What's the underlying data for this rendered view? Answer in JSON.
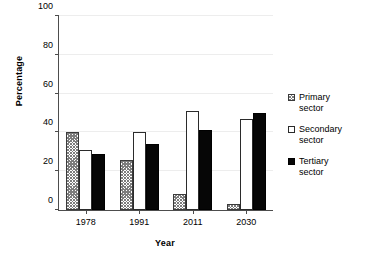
{
  "chart_data": {
    "type": "bar",
    "title": "",
    "subtitle": "",
    "xlabel": "Year",
    "ylabel": "Percentage",
    "categories": [
      "1978",
      "1991",
      "2011",
      "2030"
    ],
    "series": [
      {
        "name": "Primary sector",
        "values": [
          40,
          26,
          8,
          3
        ],
        "swatch": "hatched-square"
      },
      {
        "name": "Secondary sector",
        "values": [
          31,
          40,
          51,
          47
        ],
        "swatch": "white-square"
      },
      {
        "name": "Tertiary sector",
        "values": [
          29,
          34,
          41,
          50
        ],
        "swatch": "black-square"
      }
    ],
    "ylim": [
      0,
      100
    ],
    "yticks": [
      0,
      20,
      40,
      60,
      80,
      100
    ],
    "ytick_labels": [
      "0",
      "20",
      "40",
      "60",
      "80",
      "100"
    ],
    "grid": "horizontal",
    "legend_position": "right",
    "colors": {
      "primary": "#7d7d7d",
      "secondary": "#ffffff",
      "tertiary": "#060606",
      "axis": "#4d4d4d",
      "gridline": "#ededed",
      "background": "#ffffff"
    }
  },
  "legend": {
    "items": [
      {
        "label_line1": "Primary",
        "label_line2": "sector"
      },
      {
        "label_line1": "Secondary",
        "label_line2": "sector"
      },
      {
        "label_line1": "Tertiary",
        "label_line2": "sector"
      }
    ]
  },
  "axes": {
    "y_title": "Percentage",
    "x_title": "Year",
    "y_labels": [
      "100",
      "80",
      "60",
      "40",
      "20",
      "0"
    ],
    "x_labels": [
      "1978",
      "1991",
      "2011",
      "2030"
    ]
  }
}
